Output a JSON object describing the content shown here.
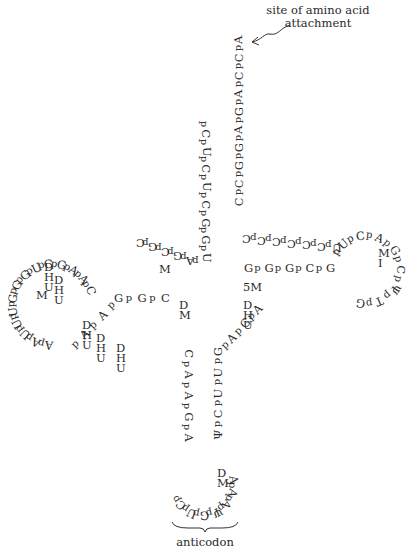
{
  "labels": {
    "attachment_line1": "site of amino acid",
    "attachment_line2": "attachment",
    "anticodon": "anticodon"
  },
  "segments": [
    {
      "name": "acceptor-3prime-strand",
      "text": "CpCpGpGpApGpApCpCpA",
      "x1": 239,
      "y1": 202,
      "x2": 239,
      "y2": 40,
      "rot": -90
    },
    {
      "name": "acceptor-5prime-strand",
      "text": "pCpUpCpUpCpGpGpU",
      "x1": 205,
      "y1": 125,
      "x2": 205,
      "y2": 258,
      "rot": 90
    },
    {
      "name": "junction-top",
      "text": "pApGpCpGpC",
      "x1": 196,
      "y1": 262,
      "x2": 140,
      "y2": 242,
      "rot": 180
    },
    {
      "name": "d-stem-lower",
      "text": "GpGpC",
      "x1": 118,
      "y1": 299,
      "x2": 165,
      "y2": 299,
      "rot": 0
    },
    {
      "name": "d-loop-exit",
      "text": "pApAp",
      "x1": 76,
      "y1": 345,
      "x2": 112,
      "y2": 306,
      "rot": -45
    },
    {
      "name": "t-stem-upper",
      "text": "CpCpCpCpCpCpU",
      "x1": 246,
      "y1": 238,
      "x2": 336,
      "y2": 247,
      "rot": 180
    },
    {
      "name": "t-stem-lower",
      "text": "GpGpGpCpG",
      "x1": 248,
      "y1": 269,
      "x2": 330,
      "y2": 269,
      "rot": 0
    },
    {
      "name": "anticodon-stem-left",
      "text": "CpApApGpA",
      "x1": 188,
      "y1": 354,
      "x2": 188,
      "y2": 438,
      "rot": 90
    },
    {
      "name": "anticodon-stem-right",
      "text": "ΨpCpUpUpG",
      "x1": 218,
      "y1": 435,
      "x2": 218,
      "y2": 352,
      "rot": -90
    },
    {
      "name": "variable-loop",
      "text": "pApGpA",
      "x1": 226,
      "y1": 346,
      "x2": 258,
      "y2": 310,
      "rot": -45
    }
  ],
  "arcs": [
    {
      "name": "d-loop",
      "text": "CpApApGpCpUpGpGpGpUpUpUpApA",
      "cx": 52,
      "cy": 305,
      "r": 40,
      "start": -20,
      "end": 95,
      "dir": -1
    },
    {
      "name": "t-loop",
      "text": "pUpCpApGpCpΨpTpG",
      "cx": 366,
      "cy": 270,
      "r": 34,
      "start": -150,
      "end": 100,
      "dir": 1
    },
    {
      "name": "anticodon-loop",
      "text": "pCpUpGpΨpApApA",
      "cx": 203,
      "cy": 485,
      "r": 30,
      "start": 150,
      "end": -10,
      "dir": -1
    }
  ],
  "modifications": [
    {
      "name": "dhu-1",
      "chars": [
        "D",
        "H",
        "U"
      ],
      "x": 116,
      "y": 343
    },
    {
      "name": "dhu-2",
      "chars": [
        "D",
        "H",
        "U"
      ],
      "x": 96,
      "y": 333
    },
    {
      "name": "dhu-3",
      "chars": [
        "D",
        "H",
        "U"
      ],
      "x": 82,
      "y": 320
    },
    {
      "name": "dhu-4",
      "chars": [
        "D",
        "H",
        "U"
      ],
      "x": 54,
      "y": 275
    },
    {
      "name": "dhu-5",
      "chars": [
        "D",
        "H",
        "U"
      ],
      "x": 44,
      "y": 262
    },
    {
      "name": "methyl-g-d",
      "chars": [
        "M"
      ],
      "x": 36,
      "y": 290
    },
    {
      "name": "methyl-g-junction",
      "chars": [
        "M"
      ],
      "x": 159,
      "y": 264
    },
    {
      "name": "dm-g",
      "chars": [
        "D",
        "M"
      ],
      "x": 179,
      "y": 300
    },
    {
      "name": "5m-c",
      "chars": [
        "5M"
      ],
      "x": 243,
      "y": 282
    },
    {
      "name": "dhu-variable",
      "chars": [
        "D",
        "H",
        "U"
      ],
      "x": 243,
      "y": 300
    },
    {
      "name": "methyl-i-t",
      "chars": [
        "M",
        "I"
      ],
      "x": 378,
      "y": 248
    },
    {
      "name": "dm-i-anticodon",
      "chars": [
        "D",
        "M"
      ],
      "x": 217,
      "y": 468
    }
  ],
  "annotations": {
    "arrow": {
      "x1": 258,
      "y1": 42,
      "x2": 290,
      "y2": 25
    },
    "brace": {
      "x": 172,
      "y": 520,
      "w": 64
    }
  }
}
